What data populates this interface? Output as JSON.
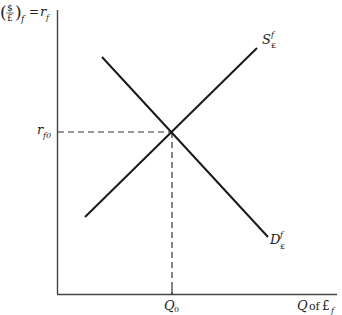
{
  "diagram": {
    "type": "supply-demand",
    "y_axis_label": {
      "fraction_num": "$",
      "fraction_den": "£",
      "subscript": "f",
      "equals": "=",
      "rhs": "r",
      "rhs_sub": "f"
    },
    "x_axis_label": {
      "q": "Q",
      "of": "of",
      "pound": "£",
      "sub": "f"
    },
    "equilibrium": {
      "price_label": "r",
      "price_sub": "f0",
      "quantity_label": "Q",
      "quantity_sub": "0"
    },
    "curves": [
      {
        "name": "supply",
        "label": "S",
        "sup": "f",
        "sub": "£",
        "from": [
          85,
          217
        ],
        "to": [
          257,
          48
        ]
      },
      {
        "name": "demand",
        "label": "D",
        "sup": "f",
        "sub": "£",
        "from": [
          102,
          57
        ],
        "to": [
          268,
          237
        ]
      }
    ],
    "colors": {
      "line": "#1a1a1a",
      "axis": "#444444",
      "dash": "#333333"
    }
  }
}
